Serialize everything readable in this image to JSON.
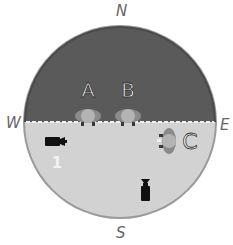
{
  "compass": {
    "north": "N",
    "south": "S",
    "east": "E",
    "west": "W"
  },
  "colors": {
    "dark_region": "#5a5a5a",
    "light_region": "#d2d2d2",
    "rim": "#9a9a9a",
    "boundary_line": "#f0f0f0",
    "person_body": "#8a8a8a",
    "person_head": "#b4b4b4",
    "person_feet": "#3a3a3a",
    "camera": "#111111",
    "label_text": "#f2f2f2",
    "label_outline": "#333333"
  },
  "people": [
    {
      "label": "A",
      "facing": "south"
    },
    {
      "label": "B",
      "facing": "south"
    },
    {
      "label": "C",
      "facing": "west"
    }
  ],
  "cameras": [
    {
      "label": "1",
      "facing": "east"
    },
    {
      "label": "",
      "facing": "north"
    }
  ]
}
